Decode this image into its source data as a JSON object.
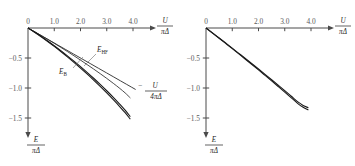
{
  "figure": {
    "background_color": "#ffffff",
    "axis_color": "#4a4a4a",
    "curve_color": "#1a1a1a"
  },
  "axis_labels": {
    "x_numerator": "U",
    "x_denominator": "πΔ",
    "y_numerator": "E",
    "y_denominator": "πΔ"
  },
  "ticks": {
    "x_labels": [
      "0",
      "1.0",
      "2.0",
      "3.0",
      "4.0"
    ],
    "x_values": [
      0,
      1.0,
      2.0,
      3.0,
      4.0
    ],
    "y_labels": [
      "−0.5",
      "−1.0",
      "−1.5"
    ],
    "y_values": [
      -0.5,
      -1.0,
      -1.5
    ]
  },
  "annotations": {
    "hf_label_base": "E",
    "hf_label_sub": "HF",
    "exact_label_base": "E",
    "exact_label_sub": "B",
    "asymptote_minus": "−",
    "asymptote_numerator": "U",
    "asymptote_denominator": "4πΔ"
  },
  "chart_data": [
    {
      "type": "line",
      "title": "",
      "panel": "left",
      "xlabel": "U/πΔ",
      "ylabel": "E/πΔ",
      "xlim": [
        0,
        4.35
      ],
      "ylim": [
        -1.62,
        0
      ],
      "grid": false,
      "legend": "inline-annotations",
      "series": [
        {
          "name": "-U/4πΔ",
          "kind": "asymptote",
          "x": [
            0,
            4.1
          ],
          "values": [
            0,
            -1.025
          ]
        },
        {
          "name": "E_HF",
          "kind": "curve",
          "x": [
            0,
            0.25,
            0.5,
            0.75,
            1.0,
            1.25,
            1.5,
            1.75,
            2.0,
            2.25,
            2.5,
            2.75,
            3.0,
            3.25,
            3.5,
            3.7,
            3.9
          ],
          "values": [
            0,
            -0.062,
            -0.125,
            -0.189,
            -0.255,
            -0.323,
            -0.392,
            -0.463,
            -0.535,
            -0.609,
            -0.684,
            -0.761,
            -0.84,
            -0.922,
            -1.008,
            -1.082,
            -1.166
          ]
        },
        {
          "name": "E_B",
          "kind": "curve",
          "x": [
            0,
            0.25,
            0.5,
            0.75,
            1.0,
            1.25,
            1.5,
            1.75,
            2.0,
            2.25,
            2.5,
            2.75,
            3.0,
            3.25,
            3.5,
            3.7,
            3.9
          ],
          "values": [
            0,
            -0.068,
            -0.14,
            -0.216,
            -0.295,
            -0.378,
            -0.464,
            -0.553,
            -0.645,
            -0.74,
            -0.838,
            -0.94,
            -1.046,
            -1.156,
            -1.272,
            -1.37,
            -1.478
          ]
        },
        {
          "name": "E_B_second",
          "kind": "curve",
          "x": [
            0,
            0.25,
            0.5,
            0.75,
            1.0,
            1.25,
            1.5,
            1.75,
            2.0,
            2.25,
            2.5,
            2.75,
            3.0,
            3.25,
            3.5,
            3.7,
            3.9
          ],
          "values": [
            0,
            -0.07,
            -0.145,
            -0.224,
            -0.306,
            -0.392,
            -0.481,
            -0.573,
            -0.668,
            -0.766,
            -0.868,
            -0.973,
            -1.082,
            -1.195,
            -1.313,
            -1.412,
            -1.52
          ]
        }
      ]
    },
    {
      "type": "line",
      "title": "",
      "panel": "right",
      "xlabel": "U/πΔ",
      "ylabel": "E/πΔ",
      "xlim": [
        0,
        4.35
      ],
      "ylim": [
        -1.62,
        0
      ],
      "grid": false,
      "legend": "none",
      "series": [
        {
          "name": "E_upper",
          "kind": "curve",
          "x": [
            0,
            0.25,
            0.5,
            0.75,
            1.0,
            1.25,
            1.5,
            1.75,
            2.0,
            2.25,
            2.5,
            2.75,
            3.0,
            3.25,
            3.5,
            3.7,
            3.9
          ],
          "values": [
            0,
            -0.083,
            -0.167,
            -0.251,
            -0.336,
            -0.422,
            -0.508,
            -0.595,
            -0.683,
            -0.772,
            -0.862,
            -0.953,
            -1.045,
            -1.138,
            -1.232,
            -1.29,
            -1.33
          ]
        },
        {
          "name": "E_lower",
          "kind": "curve",
          "x": [
            0,
            0.25,
            0.5,
            0.75,
            1.0,
            1.25,
            1.5,
            1.75,
            2.0,
            2.25,
            2.5,
            2.75,
            3.0,
            3.25,
            3.5,
            3.7,
            3.9
          ],
          "values": [
            0,
            -0.085,
            -0.171,
            -0.257,
            -0.344,
            -0.432,
            -0.52,
            -0.609,
            -0.699,
            -0.79,
            -0.882,
            -0.975,
            -1.069,
            -1.164,
            -1.26,
            -1.322,
            -1.368
          ]
        }
      ]
    }
  ]
}
